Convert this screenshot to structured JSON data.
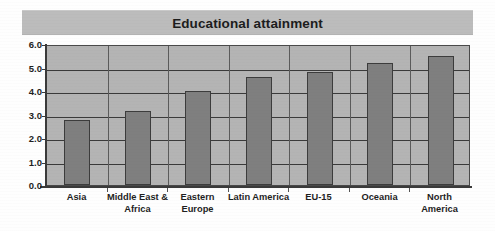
{
  "chart_data": {
    "type": "bar",
    "title": "Educational attainment",
    "xlabel": "",
    "ylabel": "",
    "ylim": [
      0.0,
      6.0
    ],
    "ytick_labels": [
      "6.0",
      "5.0",
      "4.0",
      "3.0",
      "2.0",
      "1.0",
      "0.0"
    ],
    "ytick_values": [
      6.0,
      5.0,
      4.0,
      3.0,
      2.0,
      1.0,
      0.0
    ],
    "grid": true,
    "legend": null,
    "legend_position": "none",
    "categories": [
      "Asia",
      "Middle East & Africa",
      "Eastern Europe",
      "Latin America",
      "EU-15",
      "Oceania",
      "North America"
    ],
    "category_label_lines": [
      [
        "Asia"
      ],
      [
        "Middle East &",
        "Africa"
      ],
      [
        "Eastern",
        "Europe"
      ],
      [
        "Latin America"
      ],
      [
        "EU-15"
      ],
      [
        "Oceania"
      ],
      [
        "North",
        "America"
      ]
    ],
    "values": [
      2.75,
      3.15,
      4.0,
      4.6,
      4.8,
      5.2,
      5.5
    ],
    "colors": {
      "bar_fill": "#7f7f7f",
      "bar_edge": "#3c3c3c",
      "plot_background": "#b4b4b4",
      "title_banner": "#bcbcbc",
      "gridline": "#3a3a3a",
      "axis": "#3a3a3a",
      "text": "#1f1f1f",
      "page_background": "#ffffff"
    }
  }
}
